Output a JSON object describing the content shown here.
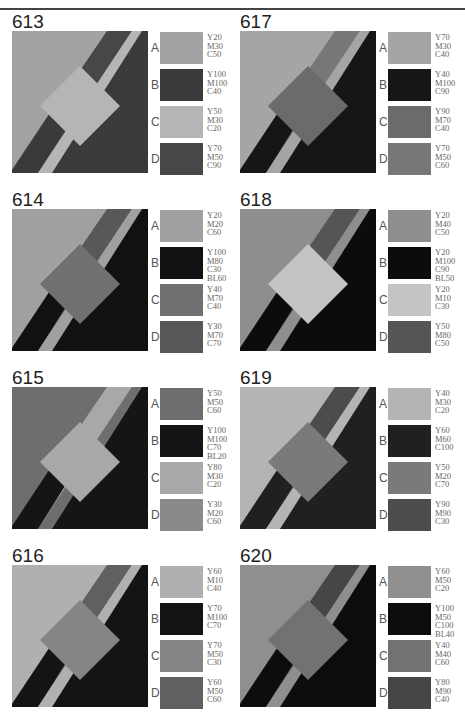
{
  "panels": [
    {
      "number": "613",
      "col": 0,
      "row": 0,
      "swatches": [
        {
          "label": "A",
          "code": "Y20\nM30\nC50",
          "color": "#a2a2a2"
        },
        {
          "label": "B",
          "code": "Y100\nM100\nC40",
          "color": "#3a3a3a"
        },
        {
          "label": "C",
          "code": "Y50\nM30\nC20",
          "color": "#b5b5b5"
        },
        {
          "label": "D",
          "code": "Y70\nM50\nC90",
          "color": "#474747"
        }
      ],
      "shape": {
        "bg": "#a2a2a2",
        "band_top": "#474747",
        "strip": "#b5b5b5",
        "band_bottom": "#3a3a3a",
        "tri": "#3a3a3a",
        "diamond": "#b5b5b5"
      }
    },
    {
      "number": "614",
      "col": 0,
      "row": 1,
      "swatches": [
        {
          "label": "A",
          "code": "Y20\nM20\nC60",
          "color": "#a0a0a0"
        },
        {
          "label": "B",
          "code": "Y100\nM80\nC30\nBL60",
          "color": "#111111"
        },
        {
          "label": "C",
          "code": "Y40\nM70\nC40",
          "color": "#707070"
        },
        {
          "label": "D",
          "code": "Y30\nM70\nC70",
          "color": "#585858"
        }
      ],
      "shape": {
        "bg": "#a0a0a0",
        "band_top": "#585858",
        "strip": "#a0a0a0",
        "band_bottom": "#111111",
        "tri": "#111111",
        "diamond": "#707070"
      }
    },
    {
      "number": "615",
      "col": 0,
      "row": 2,
      "swatches": [
        {
          "label": "A",
          "code": "Y50\nM50\nC60",
          "color": "#6e6e6e"
        },
        {
          "label": "B",
          "code": "Y100\nM100\nC70\nBL20",
          "color": "#151515"
        },
        {
          "label": "C",
          "code": "Y80\nM30\nC20",
          "color": "#a8a8a8"
        },
        {
          "label": "D",
          "code": "Y30\nM20\nC60",
          "color": "#8a8a8a"
        }
      ],
      "shape": {
        "bg": "#6e6e6e",
        "band_top": "#a8a8a8",
        "strip": "#6e6e6e",
        "band_bottom": "#151515",
        "tri": "#151515",
        "diamond": "#a8a8a8"
      }
    },
    {
      "number": "616",
      "col": 0,
      "row": 3,
      "swatches": [
        {
          "label": "A",
          "code": "Y60\nM10\nC40",
          "color": "#b0b0b0"
        },
        {
          "label": "B",
          "code": "Y70\nM100\nC70",
          "color": "#141414"
        },
        {
          "label": "C",
          "code": "Y70\nM50\nC30",
          "color": "#858585"
        },
        {
          "label": "D",
          "code": "Y60\nM50\nC60",
          "color": "#606060"
        }
      ],
      "shape": {
        "bg": "#b0b0b0",
        "band_top": "#606060",
        "strip": "#b0b0b0",
        "band_bottom": "#141414",
        "tri": "#141414",
        "diamond": "#858585"
      }
    },
    {
      "number": "617",
      "col": 1,
      "row": 0,
      "swatches": [
        {
          "label": "A",
          "code": "Y70\nM30\nC40",
          "color": "#a5a5a5"
        },
        {
          "label": "B",
          "code": "Y40\nM100\nC90",
          "color": "#161616"
        },
        {
          "label": "C",
          "code": "Y90\nM70\nC40",
          "color": "#6b6b6b"
        },
        {
          "label": "D",
          "code": "Y70\nM50\nC60",
          "color": "#777777"
        }
      ],
      "shape": {
        "bg": "#a5a5a5",
        "band_top": "#777777",
        "strip": "#a5a5a5",
        "band_bottom": "#161616",
        "tri": "#161616",
        "diamond": "#6b6b6b"
      }
    },
    {
      "number": "618",
      "col": 1,
      "row": 1,
      "swatches": [
        {
          "label": "A",
          "code": "Y20\nM40\nC50",
          "color": "#8e8e8e"
        },
        {
          "label": "B",
          "code": "Y20\nM100\nC90\nBL50",
          "color": "#0c0c0c"
        },
        {
          "label": "C",
          "code": "Y20\nM10\nC30",
          "color": "#c4c4c4"
        },
        {
          "label": "D",
          "code": "Y50\nM80\nC50",
          "color": "#555555"
        }
      ],
      "shape": {
        "bg": "#8e8e8e",
        "band_top": "#555555",
        "strip": "#8e8e8e",
        "band_bottom": "#0c0c0c",
        "tri": "#0c0c0c",
        "diamond": "#c4c4c4"
      }
    },
    {
      "number": "619",
      "col": 1,
      "row": 2,
      "swatches": [
        {
          "label": "A",
          "code": "Y40\nM30\nC20",
          "color": "#b4b4b4"
        },
        {
          "label": "B",
          "code": "Y60\nM60\nC100",
          "color": "#202020"
        },
        {
          "label": "C",
          "code": "Y50\nM20\nC70",
          "color": "#7a7a7a"
        },
        {
          "label": "D",
          "code": "Y90\nM90\nC30",
          "color": "#4c4c4c"
        }
      ],
      "shape": {
        "bg": "#b4b4b4",
        "band_top": "#4c4c4c",
        "strip": "#b4b4b4",
        "band_bottom": "#202020",
        "tri": "#202020",
        "diamond": "#7a7a7a"
      }
    },
    {
      "number": "620",
      "col": 1,
      "row": 3,
      "swatches": [
        {
          "label": "A",
          "code": "Y60\nM50\nC20",
          "color": "#8f8f8f"
        },
        {
          "label": "B",
          "code": "Y100\nM50\nC100\nBL40",
          "color": "#0d0d0d"
        },
        {
          "label": "C",
          "code": "Y40\nM40\nC60",
          "color": "#727272"
        },
        {
          "label": "D",
          "code": "Y80\nM90\nC40",
          "color": "#464646"
        }
      ],
      "shape": {
        "bg": "#8f8f8f",
        "band_top": "#464646",
        "strip": "#8f8f8f",
        "band_bottom": "#0d0d0d",
        "tri": "#0d0d0d",
        "diamond": "#727272"
      }
    }
  ]
}
